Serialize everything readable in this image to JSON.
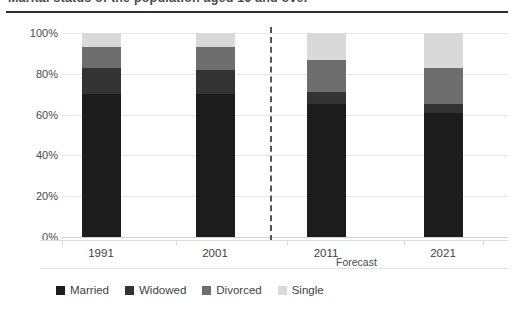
{
  "title_partial": "Marital status of the population aged 16 and over",
  "forecast_note": "Forecast",
  "chart_data": {
    "type": "bar",
    "variant": "stacked-100-percent",
    "title": "Marital status of the population aged 16 and over",
    "xlabel": "",
    "ylabel": "",
    "ylim": [
      0,
      100
    ],
    "ytick_labels": [
      "100%",
      "80%",
      "60%",
      "40%",
      "20%",
      "0%"
    ],
    "ytick_values": [
      100,
      80,
      60,
      40,
      20,
      0
    ],
    "grid": true,
    "legend_position": "bottom-left",
    "categories": [
      "1991",
      "2001",
      "2011",
      "2021"
    ],
    "annotations": [
      {
        "text": "Forecast",
        "type": "divider-label",
        "after_category": "2001"
      }
    ],
    "series": [
      {
        "name": "Married",
        "color": "#1c1c1c",
        "values": [
          70,
          70,
          65,
          61
        ]
      },
      {
        "name": "Widowed",
        "color": "#333333",
        "values": [
          13,
          12,
          6,
          4
        ]
      },
      {
        "name": "Divorced",
        "color": "#6e6e6e",
        "values": [
          10,
          11,
          16,
          18
        ]
      },
      {
        "name": "Single",
        "color": "#d9d9d9",
        "values": [
          7,
          7,
          13,
          17
        ]
      }
    ]
  },
  "legend": {
    "items": [
      {
        "label": "Married",
        "color": "#1c1c1c"
      },
      {
        "label": "Widowed",
        "color": "#333333"
      },
      {
        "label": "Divorced",
        "color": "#6e6e6e"
      },
      {
        "label": "Single",
        "color": "#d9d9d9"
      }
    ]
  },
  "axis": {
    "y_labels": [
      "100%",
      "80%",
      "60%",
      "40%",
      "20%",
      "0%"
    ],
    "x_labels": [
      "1991",
      "2001",
      "2011",
      "2021"
    ]
  }
}
